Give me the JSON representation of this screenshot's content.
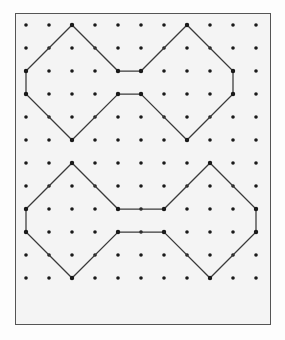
{
  "figure": {
    "kind": "dot-grid-geometry-diagram",
    "caption": "",
    "background_color": "#f4f4f4",
    "page_color": "#fdfdfd",
    "frame": {
      "name": "board-frame",
      "x": 15,
      "y": 13,
      "width": 256,
      "height": 312,
      "border_color": "#555555",
      "border_width": 1.5
    },
    "grid": {
      "columns": 11,
      "rows": 12,
      "spacing": 23,
      "origin_x": 26,
      "origin_y": 25,
      "dot_radius": 1.8,
      "dot_color": "#1a1a1a"
    },
    "stroke": {
      "color": "#3a3a3a",
      "width": 1.25
    },
    "shapes": [
      {
        "name": "top-bowtie",
        "label": "Top bowtie",
        "closed": true,
        "waist_cells": 1,
        "vertices_grid": [
          [
            0,
            2
          ],
          [
            2,
            0
          ],
          [
            4,
            2
          ],
          [
            5,
            2
          ],
          [
            7,
            0
          ],
          [
            9,
            2
          ],
          [
            9,
            3
          ],
          [
            7,
            5
          ],
          [
            5,
            3
          ],
          [
            4,
            3
          ],
          [
            2,
            5
          ],
          [
            0,
            3
          ]
        ]
      },
      {
        "name": "bottom-bowtie",
        "label": "Bottom bowtie",
        "closed": true,
        "waist_cells": 2,
        "vertices_grid": [
          [
            0,
            8
          ],
          [
            2,
            6
          ],
          [
            4,
            8
          ],
          [
            6,
            8
          ],
          [
            8,
            6
          ],
          [
            10,
            8
          ],
          [
            10,
            9
          ],
          [
            8,
            11
          ],
          [
            6,
            9
          ],
          [
            4,
            9
          ],
          [
            2,
            11
          ],
          [
            0,
            9
          ]
        ]
      }
    ]
  }
}
